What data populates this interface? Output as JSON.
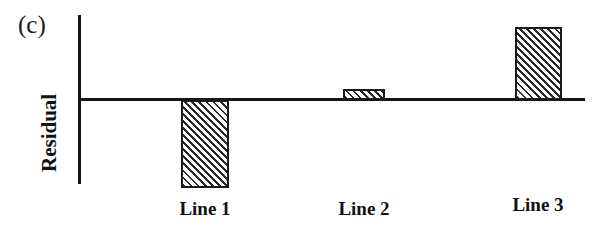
{
  "figure": {
    "panel_label": "(c)",
    "ylabel": "Residual",
    "background_color": "#ffffff",
    "axis_color": "#151515",
    "bar_edge_color": "#1a1a1a",
    "bar_hatch_color": "#2b2b2b",
    "bar_fill_color": "#ffffff"
  },
  "chart_data": {
    "type": "bar",
    "title": "(c)",
    "xlabel": "",
    "ylabel": "Residual",
    "categories": [
      "Line 1",
      "Line 2",
      "Line 3"
    ],
    "values": [
      -88,
      11,
      73
    ],
    "value_units": "pixels from zero line (unlabeled axis)",
    "ylim": [
      -98,
      84
    ],
    "grid": false,
    "legend": null,
    "zero_line": 0,
    "hatch": "diagonal-45-up",
    "bars": [
      {
        "category": "Line 1",
        "value": -88,
        "sign": "negative",
        "left_px": 181,
        "width_px": 48,
        "top_px": 100,
        "height_px": 88
      },
      {
        "category": "Line 2",
        "value": 11,
        "sign": "positive",
        "left_px": 343,
        "width_px": 42,
        "top_px": 89,
        "height_px": 11
      },
      {
        "category": "Line 3",
        "value": 73,
        "sign": "positive",
        "left_px": 515,
        "width_px": 47,
        "top_px": 27,
        "height_px": 73
      }
    ],
    "category_label_positions": [
      {
        "label": "Line 1",
        "center_x_px": 205,
        "top_px": 199
      },
      {
        "label": "Line 2",
        "center_x_px": 364,
        "top_px": 199
      },
      {
        "label": "Line 3",
        "center_x_px": 538,
        "top_px": 195
      }
    ]
  }
}
